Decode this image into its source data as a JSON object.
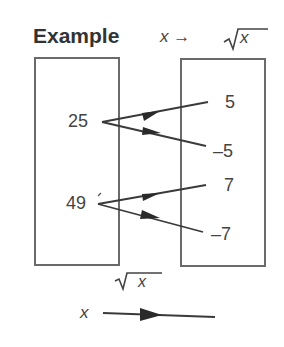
{
  "title": "Example",
  "mapping_label": {
    "input": "x",
    "arrow": "→",
    "output": "x",
    "root_symbol": "√"
  },
  "domain_set": {
    "values": [
      "25",
      "49"
    ]
  },
  "range_set": {
    "values": [
      "5",
      "–5",
      "7",
      "–7"
    ]
  },
  "mappings": [
    {
      "from": "25",
      "to": "5"
    },
    {
      "from": "25",
      "to": "–5"
    },
    {
      "from": "49",
      "to": "7"
    },
    {
      "from": "49",
      "to": "–7"
    }
  ],
  "legend": {
    "function_label": "x",
    "input_label": "x"
  },
  "colors": {
    "line": "#3a3a3a",
    "box": "#6a6a6a"
  }
}
